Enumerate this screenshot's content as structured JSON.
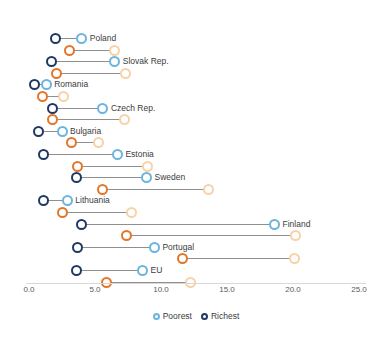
{
  "chart_data": {
    "type": "scatter",
    "subtype": "dumbbell",
    "title": "",
    "xlabel": "",
    "ylabel": "",
    "xlim": [
      0.0,
      25.0
    ],
    "xticks": [
      0.0,
      5.0,
      10.0,
      15.0,
      20.0,
      25.0
    ],
    "xtick_labels": [
      "0.0",
      "5.0",
      "10.0",
      "15.0",
      "20.0",
      "25.0"
    ],
    "grid": false,
    "legend_position": "bottom",
    "legend": [
      {
        "name": "Poorest",
        "color": "#6cb4dd"
      },
      {
        "name": "Richest",
        "color": "#1f3864"
      }
    ],
    "colors": {
      "richest_blue": "#1f3864",
      "poorest_blue": "#6cb4dd",
      "richest_orange": "#e3762b",
      "poorest_orange": "#f7d2a8",
      "connector": "#8f8f8f",
      "axis": "#d8d8d8",
      "text": "#3c3c3c"
    },
    "categories": [
      "Poland",
      "Slovak Rep.",
      "Romania",
      "Czech Rep.",
      "Bulgaria",
      "Estonia",
      "Sweden",
      "Lithuania",
      "Finland",
      "Portugal",
      "EU"
    ],
    "series": [
      {
        "name": "Richest (blue group)",
        "values": [
          2.0,
          1.7,
          0.4,
          1.8,
          0.7,
          1.1,
          3.6,
          1.1,
          4.0,
          3.7,
          3.6
        ]
      },
      {
        "name": "Poorest (blue group)",
        "values": [
          4.0,
          6.5,
          1.3,
          5.6,
          2.5,
          6.7,
          8.9,
          2.9,
          18.6,
          9.5,
          8.6
        ]
      },
      {
        "name": "Richest (orange group)",
        "values": [
          3.1,
          2.1,
          1.0,
          1.8,
          3.2,
          3.7,
          5.6,
          2.5,
          7.4,
          11.6,
          5.9
        ]
      },
      {
        "name": "Poorest (orange group)",
        "values": [
          6.5,
          7.3,
          2.6,
          7.2,
          5.3,
          9.0,
          13.6,
          7.8,
          20.2,
          20.1,
          12.2
        ]
      }
    ],
    "rows": [
      {
        "label": "Poland",
        "blue_rich": 2.0,
        "blue_poor": 4.0,
        "orange_rich": 3.1,
        "orange_poor": 6.5
      },
      {
        "label": "Slovak Rep.",
        "blue_rich": 1.7,
        "blue_poor": 6.5,
        "orange_rich": 2.1,
        "orange_poor": 7.3
      },
      {
        "label": "Romania",
        "blue_rich": 0.4,
        "blue_poor": 1.3,
        "orange_rich": 1.0,
        "orange_poor": 2.6
      },
      {
        "label": "Czech Rep.",
        "blue_rich": 1.8,
        "blue_poor": 5.6,
        "orange_rich": 1.8,
        "orange_poor": 7.2
      },
      {
        "label": "Bulgaria",
        "blue_rich": 0.7,
        "blue_poor": 2.5,
        "orange_rich": 3.2,
        "orange_poor": 5.3
      },
      {
        "label": "Estonia",
        "blue_rich": 1.1,
        "blue_poor": 6.7,
        "orange_rich": 3.7,
        "orange_poor": 9.0
      },
      {
        "label": "Sweden",
        "blue_rich": 3.6,
        "blue_poor": 8.9,
        "orange_rich": 5.6,
        "orange_poor": 13.6
      },
      {
        "label": "Lithuania",
        "blue_rich": 1.1,
        "blue_poor": 2.9,
        "orange_rich": 2.5,
        "orange_poor": 7.8
      },
      {
        "label": "Finland",
        "blue_rich": 4.0,
        "blue_poor": 18.6,
        "orange_rich": 7.4,
        "orange_poor": 20.2
      },
      {
        "label": "Portugal",
        "blue_rich": 3.7,
        "blue_poor": 9.5,
        "orange_rich": 11.6,
        "orange_poor": 20.1
      },
      {
        "label": "EU",
        "blue_rich": 3.6,
        "blue_poor": 8.6,
        "orange_rich": 5.9,
        "orange_poor": 12.2
      }
    ]
  }
}
